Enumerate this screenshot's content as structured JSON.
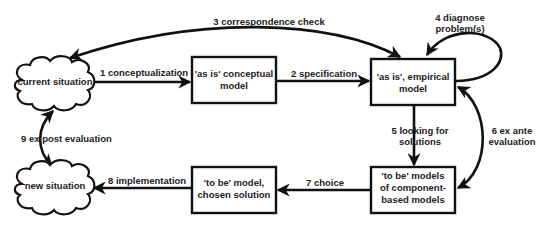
{
  "nodes": {
    "current_situation": {
      "label": "current situation",
      "shape": "cloud"
    },
    "new_situation": {
      "label": "new situation",
      "shape": "cloud"
    },
    "as_is_conceptual": {
      "lines": [
        "'as is' conceptual",
        "model"
      ],
      "shape": "box"
    },
    "as_is_empirical": {
      "lines": [
        "'as is', empirical",
        "model"
      ],
      "shape": "box"
    },
    "to_be_component": {
      "lines": [
        "'to be' models",
        "of component-",
        "based models"
      ],
      "shape": "box"
    },
    "to_be_chosen": {
      "lines": [
        "'to be' model,",
        "chosen solution"
      ],
      "shape": "box"
    }
  },
  "edges": [
    {
      "id": "e1",
      "label": "1 conceptualization",
      "from": "current_situation",
      "to": "as_is_conceptual"
    },
    {
      "id": "e2",
      "label": "2 specification",
      "from": "as_is_conceptual",
      "to": "as_is_empirical"
    },
    {
      "id": "e3",
      "label": "3 correspondence check",
      "from": "as_is_empirical",
      "to": "current_situation",
      "bidirectional": true
    },
    {
      "id": "e4",
      "lines": [
        "4 diagnose",
        "problem(s)"
      ],
      "from": "as_is_empirical",
      "to": "as_is_empirical"
    },
    {
      "id": "e5",
      "lines": [
        "5 looking for",
        "solutions"
      ],
      "from": "as_is_empirical",
      "to": "to_be_component"
    },
    {
      "id": "e6",
      "lines": [
        "6 ex ante",
        "evaluation"
      ],
      "from": "to_be_component",
      "to": "as_is_empirical",
      "bidirectional": true
    },
    {
      "id": "e7",
      "label": "7 choice",
      "from": "to_be_component",
      "to": "to_be_chosen"
    },
    {
      "id": "e8",
      "label": "8 implementation",
      "from": "to_be_chosen",
      "to": "new_situation"
    },
    {
      "id": "e9",
      "label": "9 ex post evaluation",
      "from": "current_situation",
      "to": "new_situation",
      "bidirectional": true
    }
  ]
}
